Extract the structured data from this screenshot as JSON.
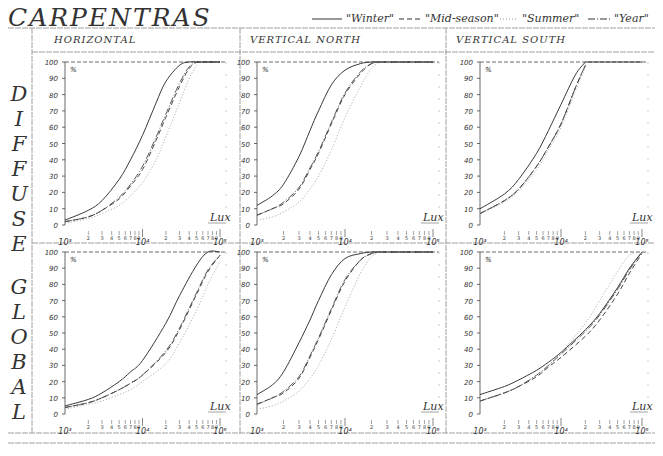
{
  "header": {
    "title": "CARPENTRAS",
    "legend": [
      {
        "label": "\"Winter\"",
        "style": "solid"
      },
      {
        "label": "\"Mid-season\"",
        "style": "dashed"
      },
      {
        "label": "\"Summer\"",
        "style": "dotted"
      },
      {
        "label": "\"Year\"",
        "style": "dashdot"
      }
    ]
  },
  "columns": [
    "HORIZONTAL",
    "VERTICAL NORTH",
    "VERTICAL SOUTH"
  ],
  "rows": [
    "DIFFUSE",
    "GLOBAL"
  ],
  "row_letters": {
    "DIFFUSE": [
      "D",
      "I",
      "F",
      "F",
      "U",
      "S",
      "E"
    ],
    "GLOBAL": [
      "G",
      "L",
      "O",
      "B",
      "A",
      "L"
    ]
  },
  "axis": {
    "y_ticks": [
      0,
      10,
      20,
      30,
      40,
      50,
      60,
      70,
      80,
      90,
      100
    ],
    "y_unit": "%",
    "x_label": "Lux",
    "x_major": [
      "10³",
      "10⁴",
      "10⁵"
    ],
    "x_minor": [
      "2",
      "3",
      "4",
      "5",
      "6",
      "7",
      "8",
      "9"
    ]
  },
  "chart_data": [
    {
      "type": "line",
      "title": "DIFFUSE — HORIZONTAL",
      "xlabel": "Lux",
      "ylabel": "%",
      "xscale": "log",
      "xlim": [
        1000,
        100000
      ],
      "ylim": [
        0,
        100
      ],
      "x": [
        1000,
        2000,
        3000,
        5000,
        7000,
        10000,
        15000,
        20000,
        30000,
        40000,
        50000
      ],
      "series": [
        {
          "name": "Winter",
          "values": [
            3,
            9,
            15,
            28,
            40,
            55,
            75,
            88,
            98,
            100,
            100
          ]
        },
        {
          "name": "Mid-season",
          "values": [
            2,
            5,
            9,
            16,
            24,
            34,
            52,
            66,
            85,
            96,
            100
          ]
        },
        {
          "name": "Summer",
          "values": [
            1,
            4,
            7,
            12,
            18,
            26,
            40,
            54,
            75,
            90,
            98
          ]
        },
        {
          "name": "Year",
          "values": [
            2,
            5,
            9,
            17,
            25,
            36,
            54,
            68,
            87,
            97,
            100
          ]
        }
      ]
    },
    {
      "type": "line",
      "title": "DIFFUSE — VERTICAL NORTH",
      "xlabel": "Lux",
      "ylabel": "%",
      "xscale": "log",
      "xlim": [
        1000,
        100000
      ],
      "ylim": [
        0,
        100
      ],
      "x": [
        1000,
        1500,
        2000,
        3000,
        4000,
        5000,
        7000,
        10000,
        15000,
        20000,
        25000
      ],
      "series": [
        {
          "name": "Winter",
          "values": [
            12,
            18,
            25,
            42,
            58,
            70,
            86,
            95,
            99,
            100,
            100
          ]
        },
        {
          "name": "Mid-season",
          "values": [
            6,
            10,
            13,
            22,
            34,
            44,
            62,
            80,
            93,
            99,
            100
          ]
        },
        {
          "name": "Summer",
          "values": [
            3,
            5,
            8,
            14,
            22,
            30,
            46,
            66,
            85,
            96,
            100
          ]
        },
        {
          "name": "Year",
          "values": [
            6,
            10,
            14,
            23,
            35,
            45,
            63,
            81,
            94,
            99,
            100
          ]
        }
      ]
    },
    {
      "type": "line",
      "title": "DIFFUSE — VERTICAL SOUTH",
      "xlabel": "Lux",
      "ylabel": "%",
      "xscale": "log",
      "xlim": [
        1000,
        100000
      ],
      "ylim": [
        0,
        100
      ],
      "x": [
        1000,
        2000,
        3000,
        5000,
        7000,
        10000,
        15000,
        20000
      ],
      "series": [
        {
          "name": "Winter",
          "values": [
            10,
            19,
            28,
            44,
            58,
            74,
            92,
            100
          ]
        },
        {
          "name": "Mid-season",
          "values": [
            7,
            15,
            22,
            36,
            48,
            62,
            84,
            98
          ]
        },
        {
          "name": "Summer",
          "values": [
            7,
            14,
            21,
            34,
            46,
            60,
            82,
            97
          ]
        },
        {
          "name": "Year",
          "values": [
            7,
            15,
            22,
            36,
            48,
            62,
            84,
            98
          ]
        }
      ]
    },
    {
      "type": "line",
      "title": "GLOBAL — HORIZONTAL",
      "xlabel": "Lux",
      "ylabel": "%",
      "xscale": "log",
      "xlim": [
        1000,
        100000
      ],
      "ylim": [
        0,
        100
      ],
      "x": [
        1000,
        2000,
        3000,
        5000,
        7000,
        10000,
        20000,
        30000,
        50000,
        70000,
        100000
      ],
      "series": [
        {
          "name": "Winter",
          "values": [
            5,
            9,
            13,
            20,
            26,
            33,
            56,
            73,
            92,
            100,
            100
          ]
        },
        {
          "name": "Mid-season",
          "values": [
            4,
            7,
            10,
            15,
            19,
            24,
            38,
            52,
            74,
            88,
            98
          ]
        },
        {
          "name": "Summer",
          "values": [
            3,
            6,
            8,
            12,
            15,
            20,
            31,
            44,
            64,
            80,
            94
          ]
        },
        {
          "name": "Year",
          "values": [
            4,
            7,
            10,
            15,
            19,
            24,
            39,
            53,
            75,
            89,
            98
          ]
        }
      ]
    },
    {
      "type": "line",
      "title": "GLOBAL — VERTICAL NORTH",
      "xlabel": "Lux",
      "ylabel": "%",
      "xscale": "log",
      "xlim": [
        1000,
        100000
      ],
      "ylim": [
        0,
        100
      ],
      "x": [
        1000,
        1500,
        2000,
        3000,
        4000,
        5000,
        7000,
        10000,
        15000,
        20000,
        25000
      ],
      "series": [
        {
          "name": "Winter",
          "values": [
            12,
            18,
            26,
            44,
            58,
            70,
            86,
            96,
            99,
            100,
            100
          ]
        },
        {
          "name": "Mid-season",
          "values": [
            6,
            10,
            13,
            22,
            35,
            46,
            64,
            82,
            95,
            99,
            100
          ]
        },
        {
          "name": "Summer",
          "values": [
            3,
            5,
            8,
            14,
            22,
            30,
            46,
            66,
            87,
            97,
            100
          ]
        },
        {
          "name": "Year",
          "values": [
            6,
            10,
            14,
            23,
            36,
            47,
            65,
            83,
            95,
            99,
            100
          ]
        }
      ]
    },
    {
      "type": "line",
      "title": "GLOBAL — VERTICAL SOUTH",
      "xlabel": "Lux",
      "ylabel": "%",
      "xscale": "log",
      "xlim": [
        1000,
        100000
      ],
      "ylim": [
        0,
        100
      ],
      "x": [
        1000,
        2000,
        3000,
        5000,
        7000,
        10000,
        20000,
        30000,
        50000,
        70000,
        100000
      ],
      "series": [
        {
          "name": "Winter",
          "values": [
            12,
            17,
            21,
            27,
            32,
            38,
            52,
            62,
            78,
            90,
            100
          ]
        },
        {
          "name": "Mid-season",
          "values": [
            8,
            13,
            17,
            23,
            29,
            35,
            48,
            58,
            74,
            87,
            99
          ]
        },
        {
          "name": "Summer",
          "values": [
            8,
            13,
            17,
            24,
            30,
            38,
            56,
            70,
            88,
            98,
            100
          ]
        },
        {
          "name": "Year",
          "values": [
            8,
            13,
            17,
            24,
            30,
            37,
            51,
            61,
            77,
            89,
            100
          ]
        }
      ]
    }
  ]
}
